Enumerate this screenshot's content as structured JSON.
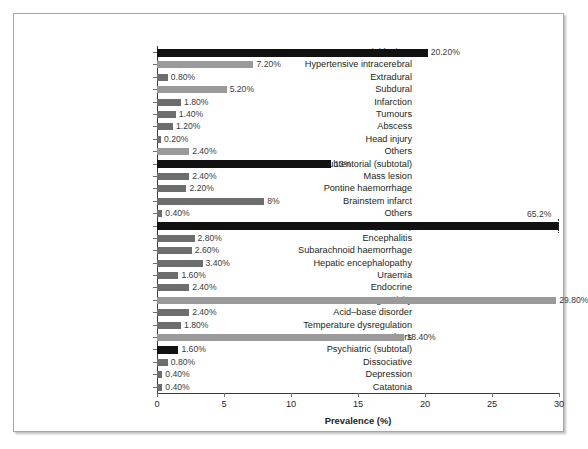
{
  "chart_data": {
    "type": "bar",
    "orientation": "horizontal",
    "title": "",
    "xlabel": "Prevalence (%)",
    "ylabel": "",
    "xlim": [
      0,
      30
    ],
    "xticks": [
      0,
      5,
      10,
      15,
      20,
      25,
      30
    ],
    "xticklabels": [
      "0",
      "5",
      "10",
      "15",
      "20",
      "25",
      "30"
    ],
    "grid": false,
    "legend": null,
    "axis_break_note": "Metabolic (subtotal) bar is truncated at 30% with a dotted break marker; true value 65.2%",
    "colors": {
      "subtotal_bar": "#111111",
      "item_bar_dark": "#6d6d6d",
      "item_bar_light": "#9a9a9a",
      "axis": "#3b3b3b",
      "text": "#231f20",
      "frame": "#a6a6a6",
      "background": "#ffffff"
    },
    "categories": [
      "Supratentorial lesions",
      "Hypertensive intracerebral",
      "Extradural",
      "Subdural",
      "Infarction",
      "Tumours",
      "Abscess",
      "Head injury",
      "Others",
      "Subtentorial (subtotal)",
      "Mass lesion",
      "Pontine haemorrhage",
      "Brainstem infarct",
      "Others",
      "Metabolic (subtotal)",
      "Encephalitis",
      "Subarachnoid haemorrhage",
      "Hepatic encephalopathy",
      "Uraemia",
      "Endocrine",
      "Drug toxicity",
      "Acid–base disorder",
      "Temperature dysregulation",
      "Others",
      "Psychiatric (subtotal)",
      "Dissociative",
      "Depression",
      "Catatonia"
    ],
    "values": [
      20.2,
      7.2,
      0.8,
      5.2,
      1.8,
      1.4,
      1.2,
      0.2,
      2.4,
      13.0,
      2.4,
      2.2,
      8.0,
      0.4,
      65.2,
      2.8,
      2.6,
      3.4,
      1.6,
      2.4,
      29.8,
      2.4,
      1.8,
      18.4,
      1.6,
      0.8,
      0.4,
      0.4
    ],
    "value_labels": [
      "20.20%",
      "7.20%",
      "0.80%",
      "5.20%",
      "1.80%",
      "1.40%",
      "1.20%",
      "0.20%",
      "2.40%",
      "13%",
      "2.40%",
      "2.20%",
      "8%",
      "0.40%",
      "65.2%",
      "2.80%",
      "2.60%",
      "3.40%",
      "1.60%",
      "2.40%",
      "29.80%",
      "2.40%",
      "1.80%",
      "18.40%",
      "1.60%",
      "0.80%",
      "0.40%",
      "0.40%"
    ],
    "bar_styles": [
      "subtotal",
      "light",
      "dark",
      "light",
      "dark",
      "dark",
      "dark",
      "dark",
      "light",
      "subtotal",
      "dark",
      "dark",
      "dark",
      "dark",
      "subtotal",
      "dark",
      "dark",
      "dark",
      "dark",
      "dark",
      "light",
      "dark",
      "dark",
      "light",
      "subtotal",
      "dark",
      "dark",
      "dark"
    ]
  }
}
